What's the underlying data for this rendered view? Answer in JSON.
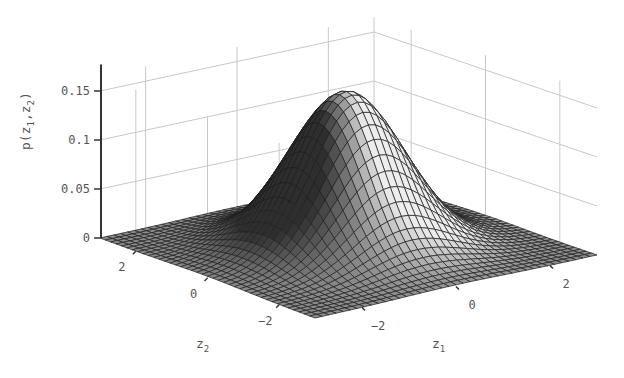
{
  "chart_data": {
    "type": "surface",
    "title": "",
    "xlabel": "z_1",
    "ylabel": "z_2",
    "zlabel": "p(z_1,z_2)",
    "x_range": [
      -3,
      3
    ],
    "y_range": [
      -3,
      3
    ],
    "zlim": [
      0,
      0.16
    ],
    "x_ticks": [
      -2,
      0,
      2
    ],
    "y_ticks": [
      -2,
      0,
      2
    ],
    "z_ticks": [
      0,
      0.05,
      0.1,
      0.15
    ],
    "z_tick_labels": [
      "0",
      "0.05",
      "0.1",
      "0.15"
    ],
    "grid": true,
    "mesh_resolution": 40,
    "peak": {
      "z1": 0,
      "z2": 0,
      "p": 0.159
    },
    "colormap": "gray"
  },
  "labels": {
    "zaxis_main": "p(z",
    "zaxis_sub1": "1",
    "zaxis_mid": ",z",
    "zaxis_sub2": "2",
    "zaxis_end": ")",
    "x_main": "z",
    "x_sub": "1",
    "y_main": "z",
    "y_sub": "2"
  }
}
